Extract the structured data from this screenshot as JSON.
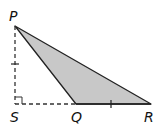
{
  "diagram": {
    "type": "geometry",
    "points": {
      "P": {
        "label": "P",
        "x": 15,
        "y": 26
      },
      "S": {
        "label": "S",
        "x": 15,
        "y": 104
      },
      "Q": {
        "label": "Q",
        "x": 76,
        "y": 104
      },
      "R": {
        "label": "R",
        "x": 151,
        "y": 104
      }
    },
    "segments": [
      {
        "from": "P",
        "to": "S",
        "style": "dashed",
        "tick": true
      },
      {
        "from": "S",
        "to": "Q",
        "style": "dashed"
      },
      {
        "from": "Q",
        "to": "R",
        "style": "solid",
        "tick": true
      },
      {
        "from": "P",
        "to": "R",
        "style": "solid"
      },
      {
        "from": "P",
        "to": "Q",
        "style": "solid"
      }
    ],
    "shaded_region": [
      "P",
      "Q",
      "R"
    ],
    "right_angle_at": "S",
    "colors": {
      "fill": "#c8c8c8",
      "stroke": "#222222"
    }
  }
}
